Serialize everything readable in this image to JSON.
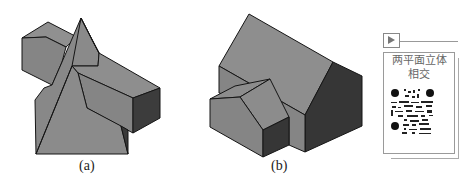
{
  "figures": [
    {
      "id": "a",
      "caption": "(a)",
      "description": "pyramid intersecting horizontal rectangular prism"
    },
    {
      "id": "b",
      "caption": "(b)",
      "description": "two gable-roof prisms intersecting"
    }
  ],
  "qr_card": {
    "icon": "play-icon",
    "title_line1": "两平面立体",
    "title_line2": "相交"
  },
  "colors": {
    "face_light": "#8c8c8c",
    "face_mid": "#7b7b7b",
    "face_dark": "#3a3a3a",
    "edge": "#111111"
  }
}
